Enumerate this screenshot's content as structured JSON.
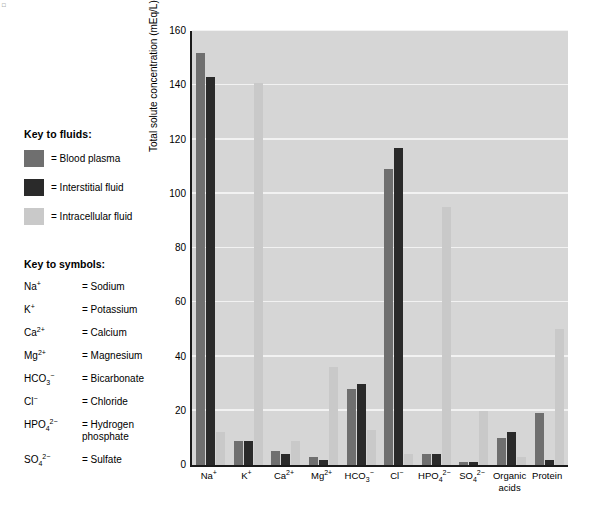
{
  "corner_mark": "□",
  "fluid_key": {
    "title": "Key to fluids:",
    "items": [
      {
        "label": "= Blood plasma",
        "color": "#6f6f6f",
        "name": "blood-plasma"
      },
      {
        "label": "= Interstitial fluid",
        "color": "#2a2a2a",
        "name": "interstitial-fluid"
      },
      {
        "label": "= Intracellular fluid",
        "color": "#c9c9c9",
        "name": "intracellular-fluid"
      }
    ]
  },
  "symbol_key": {
    "title": "Key to symbols:",
    "items": [
      {
        "symbol_html": "Na<sup>+</sup>",
        "value": "= Sodium"
      },
      {
        "symbol_html": "K<sup>+</sup>",
        "value": "= Potassium"
      },
      {
        "symbol_html": "Ca<sup>2+</sup>",
        "value": "= Calcium"
      },
      {
        "symbol_html": "Mg<sup>2+</sup>",
        "value": "= Magnesium"
      },
      {
        "symbol_html": "HCO<sub>3</sub><sup>−</sup>",
        "value": "= Bicarbonate"
      },
      {
        "symbol_html": "Cl<sup>−</sup>",
        "value": "= Chloride"
      },
      {
        "symbol_html": "HPO<sub>4</sub><sup>2−</sup>",
        "value": "= Hydrogen phosphate"
      },
      {
        "symbol_html": "SO<sub>4</sub><sup>2−</sup>",
        "value": "= Sulfate"
      }
    ]
  },
  "chart_data": {
    "type": "bar",
    "title": "",
    "xlabel": "",
    "ylabel": "Total solute concentration (mEq/L)",
    "ylim": [
      0,
      160
    ],
    "yticks": [
      0,
      20,
      40,
      60,
      80,
      100,
      120,
      140,
      160
    ],
    "grid": true,
    "legend_position": "left-external",
    "categories": [
      "Na+",
      "K+",
      "Ca2+",
      "Mg2+",
      "HCO3-",
      "Cl-",
      "HPO4 2-",
      "SO4 2-",
      "Organic acids",
      "Protein"
    ],
    "categories_html": [
      "Na<sup>+</sup>",
      "K<sup>+</sup>",
      "Ca<sup>2+</sup>",
      "Mg<sup>2+</sup>",
      "HCO<sub>3</sub><sup>−</sup>",
      "Cl<sup>−</sup>",
      "HPO<sub>4</sub><sup>2−</sup>",
      "SO<sub>4</sub><sup>2−</sup>",
      "Organic<br>acids",
      "Protein"
    ],
    "series": [
      {
        "name": "Blood plasma",
        "color": "#6f6f6f",
        "values": [
          152,
          9,
          5,
          3,
          28,
          109,
          4,
          1,
          10,
          19
        ]
      },
      {
        "name": "Interstitial fluid",
        "color": "#2a2a2a",
        "values": [
          143,
          9,
          4,
          2,
          30,
          117,
          4,
          1,
          12,
          2
        ]
      },
      {
        "name": "Intracellular fluid",
        "color": "#c9c9c9",
        "values": [
          12,
          141,
          9,
          36,
          13,
          4,
          95,
          20,
          3,
          50
        ]
      }
    ]
  }
}
